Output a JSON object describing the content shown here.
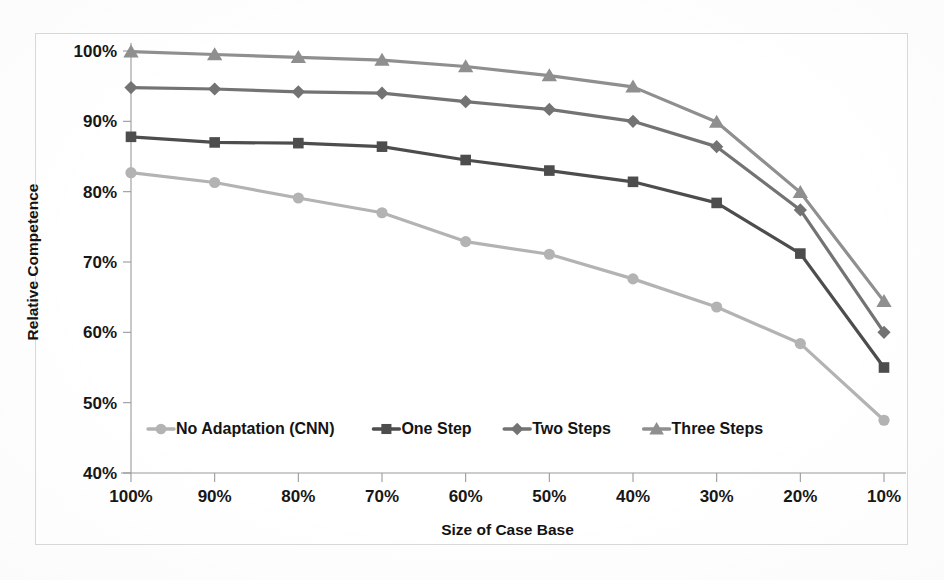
{
  "chart_data": {
    "type": "line",
    "title": "",
    "xlabel": "Size of Case Base",
    "ylabel": "Relative Competence",
    "categories": [
      "100%",
      "90%",
      "80%",
      "70%",
      "60%",
      "50%",
      "40%",
      "30%",
      "20%",
      "10%"
    ],
    "x_tick_labels": [
      "100%",
      "90%",
      "80%",
      "70%",
      "60%",
      "50%",
      "40%",
      "30%",
      "20%",
      "10%"
    ],
    "y_tick_labels": [
      "40%",
      "50%",
      "60%",
      "70%",
      "80%",
      "90%",
      "100%"
    ],
    "y_tick_values": [
      40,
      50,
      60,
      70,
      80,
      90,
      100
    ],
    "ylim": [
      40,
      100
    ],
    "grid": false,
    "legend_position": "bottom-inside",
    "series": [
      {
        "name": "No Adaptation (CNN)",
        "marker": "circle",
        "color": "#b3b3b3",
        "values": [
          82.7,
          81.3,
          79.1,
          77.0,
          72.9,
          71.1,
          67.6,
          63.6,
          58.4,
          47.5
        ]
      },
      {
        "name": "One Step",
        "marker": "square",
        "color": "#4d4d4d",
        "values": [
          87.8,
          87.0,
          86.9,
          86.4,
          84.5,
          83.0,
          81.4,
          78.4,
          71.2,
          55.0
        ]
      },
      {
        "name": "Two Steps",
        "marker": "diamond",
        "color": "#737373",
        "values": [
          94.8,
          94.6,
          94.2,
          94.0,
          92.8,
          91.7,
          90.0,
          86.4,
          77.4,
          60.0
        ]
      },
      {
        "name": "Three Steps",
        "marker": "triangle",
        "color": "#8f8f8f",
        "values": [
          99.9,
          99.5,
          99.1,
          98.7,
          97.8,
          96.5,
          94.9,
          89.9,
          79.9,
          64.4
        ]
      }
    ]
  },
  "legend": {
    "items": [
      {
        "label": "No Adaptation (CNN)",
        "marker": "circle",
        "color": "#b3b3b3"
      },
      {
        "label": "One Step",
        "marker": "square",
        "color": "#4d4d4d"
      },
      {
        "label": "Two Steps",
        "marker": "diamond",
        "color": "#737373"
      },
      {
        "label": "Three Steps",
        "marker": "triangle",
        "color": "#8f8f8f"
      }
    ]
  }
}
